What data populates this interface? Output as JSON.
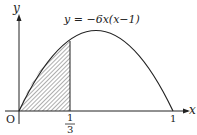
{
  "diagram": {
    "function_label": "y = −6x(x−1)",
    "axis_x_label": "x",
    "axis_y_label": "y",
    "origin_label": "O",
    "tick_third_numerator": "1",
    "tick_third_denominator": "3",
    "tick_one_label": "1",
    "shaded_region": "area under curve from x=0 to x=1/3",
    "colors": {
      "stroke": "#222222",
      "background": "#ffffff"
    }
  }
}
